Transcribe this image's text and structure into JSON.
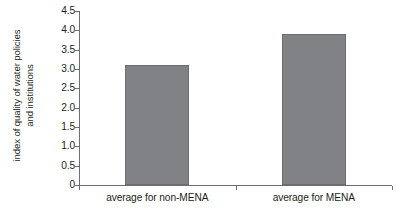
{
  "chart_data": {
    "type": "bar",
    "title": "",
    "xlabel": "",
    "ylabel": "index of quality of water policies and institutions",
    "ylabel_lines": [
      "index of quality of water policies",
      "and institutions"
    ],
    "categories": [
      "average for non-MENA",
      "average for MENA"
    ],
    "values": [
      3.1,
      3.9
    ],
    "series": [
      {
        "name": "index of quality of water policies and institutions",
        "values": [
          3.1,
          3.9
        ]
      }
    ],
    "ylim": [
      0,
      4.5
    ],
    "ytick_values": [
      0,
      0.5,
      1.0,
      1.5,
      2.0,
      2.5,
      3.0,
      3.5,
      4.0,
      4.5
    ],
    "ytick_labels": [
      "0",
      "0.5",
      "1.0",
      "1.5",
      "2.0",
      "2.5",
      "3.0",
      "3.5",
      "4.0",
      "4.5"
    ],
    "grid": false,
    "legend": false,
    "legend_position": "none",
    "bar_color": "#808285",
    "bar_edge_color": "#6a6c6e",
    "axis_color": "#6d6e71",
    "text_color": "#231f20",
    "background_color": "#ffffff",
    "annotations": []
  }
}
